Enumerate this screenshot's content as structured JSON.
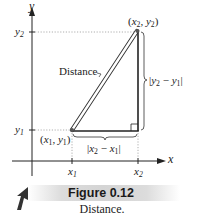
{
  "axes": {
    "x_label": "x",
    "y_label": "y"
  },
  "ticks": {
    "x1": {
      "base": "x",
      "sub": "1"
    },
    "x2": {
      "base": "x",
      "sub": "2"
    },
    "y1": {
      "base": "y",
      "sub": "1"
    },
    "y2": {
      "base": "y",
      "sub": "2"
    }
  },
  "points": {
    "p1": {
      "label_open": "(",
      "x": "x",
      "x_sub": "1",
      "sep": ", ",
      "y": "y",
      "y_sub": "1",
      "label_close": ")"
    },
    "p2": {
      "label_open": "(",
      "x": "x",
      "x_sub": "2",
      "sep": ", ",
      "y": "y",
      "y_sub": "2",
      "label_close": ")"
    }
  },
  "annotations": {
    "hypotenuse": "Distance",
    "vertical_leg": {
      "bar_open": "|",
      "a": "y",
      "a_sub": "2",
      "minus": " − ",
      "b": "y",
      "b_sub": "1",
      "bar_close": "|"
    },
    "horizontal_leg": {
      "bar_open": "|",
      "a": "x",
      "a_sub": "2",
      "minus": " − ",
      "b": "x",
      "b_sub": "1",
      "bar_close": "|"
    }
  },
  "figure": {
    "title": "Figure 0.12",
    "caption": "Distance."
  },
  "colors": {
    "line": "#222222",
    "dotted": "#9a9a9a",
    "point": "#555555",
    "band": "#d6d6d6"
  }
}
